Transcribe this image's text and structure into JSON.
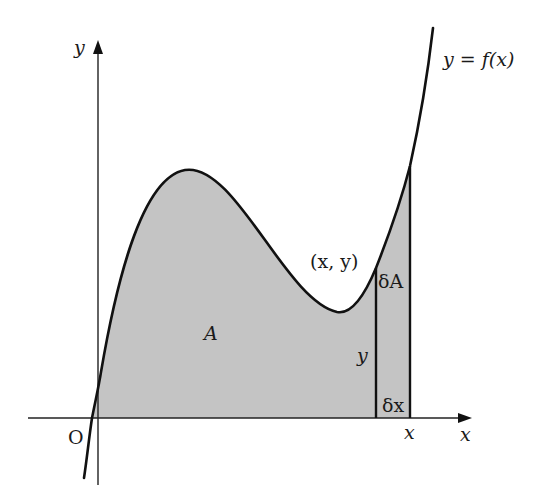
{
  "diagram": {
    "colors": {
      "background": "#ffffff",
      "shading": "#c4c4c4",
      "curve": "#111111",
      "axes": "#222222",
      "text": "#1a1a1a"
    },
    "axes": {
      "x_label": "x",
      "y_label": "y",
      "origin_label": "O"
    },
    "curve": {
      "label": "y = f(x)",
      "shape": "cubic-like: rises through origin region, local maximum, local minimum, then rises steeply"
    },
    "regions": {
      "area_label": "A",
      "strip_area_label": "δA"
    },
    "point": {
      "label": "(x, y)"
    },
    "strip": {
      "height_label": "y",
      "width_label": "δx",
      "position_label": "x"
    }
  }
}
